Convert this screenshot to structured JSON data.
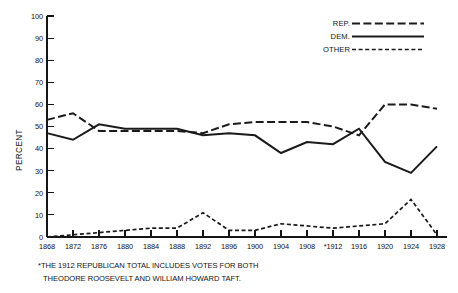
{
  "chart_data": {
    "type": "line",
    "title": "",
    "subtitle": "",
    "xlabel": "",
    "ylabel": "PERCENT",
    "xlim": [
      1868,
      1928
    ],
    "ylim": [
      0,
      100
    ],
    "grid": false,
    "legend_position": "top-right",
    "x": [
      1868,
      1872,
      1876,
      1880,
      1884,
      1888,
      1892,
      1896,
      1900,
      1904,
      1908,
      1912,
      1916,
      1920,
      1924,
      1928
    ],
    "categories": [
      "1868",
      "1872",
      "1876",
      "1880",
      "1884",
      "1888",
      "1892",
      "1896",
      "1900",
      "1904",
      "1908",
      "*1912",
      "1916",
      "1920",
      "1924",
      "1928"
    ],
    "ytick_labels": [
      "0",
      "10",
      "20",
      "30",
      "40",
      "50",
      "60",
      "70",
      "80",
      "90",
      "100"
    ],
    "ytick_values": [
      0,
      10,
      20,
      30,
      40,
      50,
      60,
      70,
      80,
      90,
      100
    ],
    "series": [
      {
        "name": "REP.",
        "style": "long-dashed",
        "values": [
          53,
          56,
          48,
          48,
          48,
          48,
          47,
          51,
          52,
          52,
          52,
          50,
          46,
          60,
          60,
          58
        ]
      },
      {
        "name": "DEM.",
        "style": "solid",
        "values": [
          47,
          44,
          51,
          49,
          49,
          49,
          46,
          47,
          46,
          38,
          43,
          42,
          49,
          34,
          29,
          41
        ]
      },
      {
        "name": "OTHER",
        "style": "short-dashed",
        "values": [
          0,
          1,
          2,
          3,
          4,
          4,
          11,
          3,
          3,
          6,
          5,
          4,
          5,
          6,
          17,
          1
        ]
      }
    ],
    "annotations": [
      "*THE 1912 REPUBLICAN TOTAL INCLUDES VOTES FOR BOTH",
      "THEODORE ROOSEVELT AND WILLIAM HOWARD TAFT."
    ]
  },
  "legend": {
    "items": [
      {
        "label": "REP."
      },
      {
        "label": "DEM."
      },
      {
        "label": "OTHER"
      }
    ]
  },
  "footnote": {
    "line1": "*THE 1912 REPUBLICAN TOTAL INCLUDES VOTES FOR BOTH",
    "line2": "THEODORE ROOSEVELT AND WILLIAM HOWARD TAFT."
  },
  "colors": {
    "ink": "#1a1a1a",
    "background": "#ffffff"
  }
}
